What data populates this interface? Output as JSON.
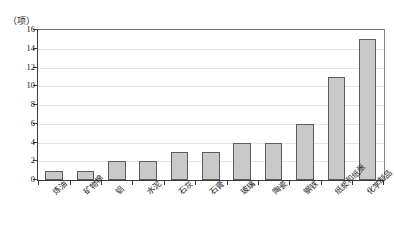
{
  "chart_data": {
    "type": "bar",
    "title": "",
    "subtitle": "",
    "xlabel": "",
    "ylabel": "",
    "y_unit_label": "（项）",
    "categories": [
      "炼油",
      "矿物棉",
      "铝",
      "水泥",
      "石灰",
      "石膏",
      "玻璃",
      "陶瓷",
      "钢铁",
      "纸浆和纸张",
      "化学制品"
    ],
    "values": [
      1,
      1,
      2,
      2,
      3,
      3,
      4,
      4,
      6,
      11,
      15
    ],
    "ylim": [
      0,
      16
    ],
    "ytick_values": [
      0,
      2,
      4,
      6,
      8,
      10,
      12,
      14,
      16
    ],
    "ytick_labels": [
      "0",
      "2",
      "4",
      "6",
      "8",
      "10",
      "12",
      "14",
      "16"
    ],
    "grid": true,
    "grid_axis": "y",
    "legend": false,
    "legend_position": "none",
    "bar_fill_color": "#c9c9c9",
    "bar_border_color": "#5c5c5c",
    "grid_color": "#e4e4e4",
    "axis_color": "#3a3a3a",
    "text_color": "#1a1a1a",
    "background_color": "#ffffff"
  }
}
